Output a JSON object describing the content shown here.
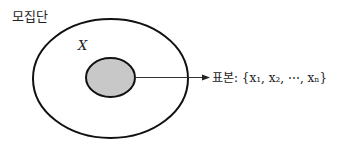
{
  "population_label": "모집단",
  "variable_label": "X",
  "sample_label": "표본: {x₁, x₂, ⋯, xₙ}",
  "colors": {
    "stroke": "#111111",
    "sample_fill": "#c8c8c8"
  }
}
